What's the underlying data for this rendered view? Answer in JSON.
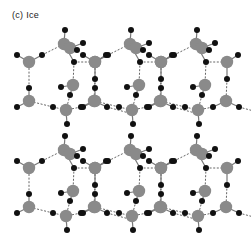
{
  "title": "(c) Ice",
  "colors": {
    "oxygen": "#8a8a8a",
    "hydrogen": "#111111",
    "covalent_bond": "#777777",
    "hydrogen_bond": "#555555",
    "background": "#ffffff"
  },
  "legend_semantics": {
    "oxygen": "grey large circle",
    "hydrogen": "black small circle",
    "hydrogen_bond": "dashed line"
  },
  "layers": [
    {
      "name": "upper",
      "y_offset": 0
    },
    {
      "name": "lower",
      "y_offset": 106
    }
  ],
  "unit_cells_x": [
    0,
    66,
    132
  ],
  "cell": {
    "oxygens": [
      [
        64,
        44
      ],
      [
        70,
        48
      ],
      [
        29,
        62
      ],
      [
        95,
        62
      ],
      [
        73,
        85
      ],
      [
        29,
        101
      ],
      [
        94,
        101
      ],
      [
        66,
        110
      ]
    ],
    "hydrogens": [
      [
        65,
        30
      ],
      [
        83,
        43
      ],
      [
        77,
        50
      ],
      [
        17,
        55
      ],
      [
        42,
        55
      ],
      [
        74,
        62
      ],
      [
        106,
        55
      ],
      [
        95,
        79
      ],
      [
        61,
        87
      ],
      [
        70,
        95
      ],
      [
        29,
        88
      ],
      [
        17,
        107
      ],
      [
        53,
        107
      ],
      [
        81,
        107
      ],
      [
        107,
        107
      ],
      [
        67,
        124
      ]
    ],
    "covalent": [
      [
        64,
        44,
        65,
        30
      ],
      [
        70,
        48,
        83,
        43
      ],
      [
        70,
        48,
        77,
        50
      ],
      [
        29,
        62,
        17,
        55
      ],
      [
        29,
        62,
        42,
        55
      ],
      [
        95,
        62,
        106,
        55
      ],
      [
        95,
        62,
        95,
        79
      ],
      [
        73,
        85,
        61,
        87
      ],
      [
        73,
        85,
        70,
        95
      ],
      [
        29,
        101,
        29,
        88
      ],
      [
        29,
        101,
        17,
        107
      ],
      [
        94,
        101,
        81,
        107
      ],
      [
        94,
        101,
        107,
        107
      ],
      [
        66,
        110,
        67,
        124
      ],
      [
        64,
        44,
        74,
        62
      ]
    ],
    "hbonds": [
      [
        42,
        55,
        64,
        44
      ],
      [
        74,
        62,
        95,
        62
      ],
      [
        74,
        62,
        73,
        85
      ],
      [
        95,
        79,
        94,
        101
      ],
      [
        29,
        88,
        29,
        62
      ],
      [
        70,
        95,
        66,
        110
      ],
      [
        53,
        107,
        66,
        110
      ],
      [
        53,
        107,
        29,
        101
      ],
      [
        81,
        107,
        66,
        110
      ],
      [
        107,
        107,
        129,
        113
      ]
    ]
  }
}
